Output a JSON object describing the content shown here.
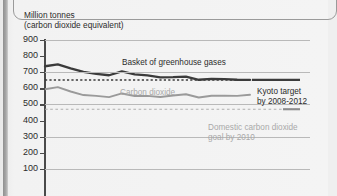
{
  "figure": {
    "title_line1": "Million tonnes",
    "title_line2": "(carbon dioxide equivalent)"
  },
  "annotations": {
    "series_basket": "Basket of greenhouse gases",
    "series_co2": "Carbon dioxide",
    "kyoto_line1": "Kyoto target",
    "kyoto_line2": "by 2008-2012",
    "domestic_line1": "Domestic carbon dioxide",
    "domestic_line2": "goal by 2010"
  },
  "colors": {
    "basket": "#3b3b3b",
    "co2": "#9a9a9a",
    "kyoto_dash": "#3b3b3b",
    "domestic_dash": "#aeaeae",
    "grid": "#b9b9b9",
    "axis": "#4a4a4a",
    "text": "#2b2b2b",
    "text_grey": "#a9a9a9"
  },
  "chart_data": {
    "type": "line",
    "title": "Million tonnes (carbon dioxide equivalent)",
    "xlabel": "",
    "ylabel": "Million tonnes (carbon dioxide equivalent)",
    "ylim": [
      0,
      900
    ],
    "yticks": [
      100,
      200,
      300,
      400,
      500,
      600,
      700,
      800,
      900
    ],
    "grid": true,
    "legend": "inline-annotations",
    "x": [
      1990,
      1991,
      1992,
      1993,
      1994,
      1995,
      1996,
      1997,
      1998,
      1999,
      2000,
      2001,
      2002,
      2003,
      2004,
      2005,
      2006
    ],
    "series": [
      {
        "name": "Basket of greenhouse gases",
        "color": "#3b3b3b",
        "style": "solid",
        "values": [
          737,
          748,
          724,
          702,
          690,
          681,
          705,
          686,
          680,
          668,
          669,
          672,
          653,
          659,
          657,
          653,
          652
        ]
      },
      {
        "name": "Carbon dioxide",
        "color": "#9a9a9a",
        "style": "solid",
        "values": [
          594,
          607,
          580,
          558,
          553,
          545,
          568,
          552,
          553,
          546,
          555,
          563,
          543,
          554,
          554,
          553,
          560
        ]
      }
    ],
    "reference_lines": [
      {
        "name": "Kyoto target by 2008-2012",
        "value": 652,
        "style": "dashed",
        "color": "#3b3b3b"
      },
      {
        "name": "Domestic carbon dioxide goal by 2010",
        "value": 470,
        "style": "dashed",
        "color": "#aeaeae"
      }
    ]
  }
}
